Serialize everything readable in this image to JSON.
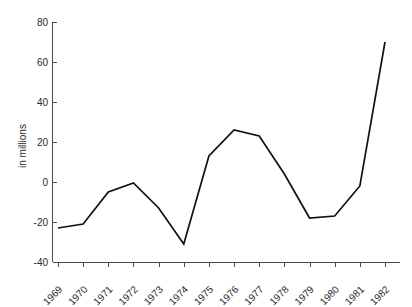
{
  "chart_data": {
    "type": "line",
    "title": "",
    "subtitle": "",
    "xlabel": "",
    "ylabel": "in millions",
    "categories": [
      "1969",
      "1970",
      "1971",
      "1972",
      "1973",
      "1974",
      "1975",
      "1976",
      "1977",
      "1978",
      "1979",
      "1980",
      "1981",
      "1982"
    ],
    "values": [
      -23,
      -21,
      -5,
      -0.5,
      -13,
      -31,
      13,
      26,
      23,
      4,
      -18,
      -17,
      -2,
      70
    ],
    "series": [
      {
        "name": "",
        "values": [
          -23,
          -21,
          -5,
          -0.5,
          -13,
          -31,
          13,
          26,
          23,
          4,
          -18,
          -17,
          -2,
          70
        ]
      }
    ],
    "ylim": [
      -40,
      80
    ],
    "ytick_labels": [
      "80",
      "60",
      "40",
      "20",
      "0",
      "-20",
      "-40"
    ],
    "ytick_values": [
      80,
      60,
      40,
      20,
      0,
      -20,
      -40
    ],
    "grid": false,
    "legend": false,
    "legend_position": "none",
    "line_color": "#111111"
  },
  "axis": {
    "y_title": "in millions",
    "x_tick_rotation": "-45"
  }
}
